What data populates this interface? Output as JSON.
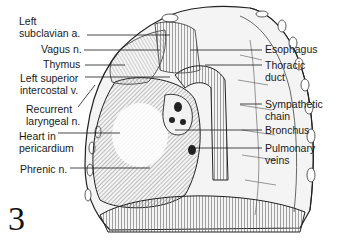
{
  "figure": {
    "number": "3"
  },
  "labels_left": [
    {
      "id": "left-subclavian-a",
      "text": "Left\nsubclavian a."
    },
    {
      "id": "vagus-n",
      "text": "Vagus n."
    },
    {
      "id": "thymus",
      "text": "Thymus"
    },
    {
      "id": "left-superior-intercostal-v",
      "text": "Left superior\nintercostal v."
    },
    {
      "id": "recurrent-laryngeal-n",
      "text": "Recurrent\nlaryngeal n."
    },
    {
      "id": "heart-in-pericardium",
      "text": "Heart in\npericardium"
    },
    {
      "id": "phrenic-n",
      "text": "Phrenic n."
    }
  ],
  "labels_right": [
    {
      "id": "esophagus",
      "text": "Esophagus"
    },
    {
      "id": "thoracic-duct",
      "text": "Thoracic\nduct"
    },
    {
      "id": "sympathetic-chain",
      "text": "Sympathetic\nchain"
    },
    {
      "id": "bronchus",
      "text": "Bronchus"
    },
    {
      "id": "pulmonary-veins",
      "text": "Pulmonary\nveins"
    }
  ],
  "colors": {
    "ink": "#1a1a1a",
    "background": "#ffffff",
    "shade": "#c8c8c8"
  }
}
